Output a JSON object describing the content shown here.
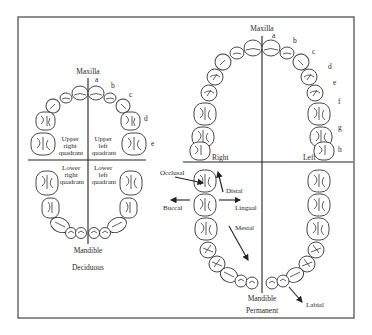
{
  "figure": {
    "deciduous": {
      "caption": "Deciduous",
      "top_label": "Maxilla",
      "bottom_label": "Mandible",
      "quadrants": {
        "upper_right": [
          "Upper",
          "right",
          "quadrant"
        ],
        "upper_left": [
          "Upper",
          "left",
          "quadrant"
        ],
        "lower_right": [
          "Lower",
          "right",
          "quadrant"
        ],
        "lower_left": [
          "Lower",
          "left",
          "quadrant"
        ]
      },
      "tooth_letters": [
        "a",
        "b",
        "c",
        "d",
        "e"
      ]
    },
    "permanent": {
      "caption": "Permanent",
      "top_label": "Maxilla",
      "bottom_label": "Mandible",
      "side_right": "Right",
      "side_left": "Left",
      "tooth_letters": [
        "a",
        "b",
        "c",
        "d",
        "e",
        "f",
        "g",
        "h"
      ],
      "directions": {
        "occlusal": "Occlusal",
        "distal": "Distal",
        "buccal": "Buccal",
        "lingual": "Lingual",
        "mesial": "Mesial",
        "labial": "Labial"
      }
    }
  }
}
